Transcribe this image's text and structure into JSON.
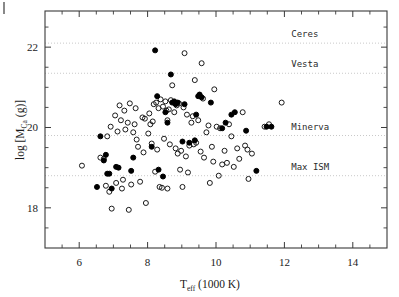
{
  "chart_data": {
    "type": "scatter",
    "title": "",
    "xlabel": "T_eff (1000 K)",
    "xlabel_main": "T",
    "xlabel_sub": "eff",
    "xlabel_rest": "(1000 K)",
    "ylabel": "log [M_Ca (g)]",
    "ylabel_main_a": "log [M",
    "ylabel_sub": "Ca",
    "ylabel_main_b": " (g)]",
    "xlim": [
      5.0,
      15.0
    ],
    "ylim": [
      17.0,
      22.9
    ],
    "xticks": [
      6,
      8,
      10,
      12,
      14
    ],
    "xtick_labels": [
      "6",
      "8",
      "10",
      "12",
      "14"
    ],
    "xminorticks": [
      5.5,
      6.5,
      7.0,
      7.5,
      8.5,
      9.0,
      9.5,
      10.5,
      11.0,
      11.5,
      12.5,
      13.0,
      13.5,
      14.5
    ],
    "yticks": [
      18,
      20,
      22
    ],
    "ytick_labels": [
      "18",
      "20",
      "22"
    ],
    "yminorticks": [
      17.5,
      18.5,
      19.0,
      19.5,
      20.5,
      21.0,
      21.5,
      22.5
    ],
    "grid": false,
    "legend": "none",
    "reference_lines": [
      {
        "label": "Ceres",
        "y": 22.1,
        "style": "dotted",
        "label_x": 12.2
      },
      {
        "label": "Vesta",
        "y": 21.35,
        "style": "dotted",
        "label_x": 12.2
      },
      {
        "label": "Minerva",
        "y": 19.8,
        "style": "dotted",
        "label_x": 12.2
      },
      {
        "label": "Max ISM",
        "y": 18.8,
        "style": "dotted",
        "label_x": 12.2
      }
    ],
    "series": [
      {
        "name": "open",
        "marker": "open-circle",
        "points": [
          [
            6.08,
            19.05
          ],
          [
            6.62,
            19.25
          ],
          [
            6.72,
            19.22
          ],
          [
            6.78,
            18.55
          ],
          [
            6.82,
            19.78
          ],
          [
            6.88,
            18.4
          ],
          [
            6.92,
            20.02
          ],
          [
            6.95,
            17.98
          ],
          [
            7.05,
            20.3
          ],
          [
            7.08,
            18.62
          ],
          [
            7.12,
            19.9
          ],
          [
            7.18,
            20.55
          ],
          [
            7.22,
            20.18
          ],
          [
            7.25,
            18.48
          ],
          [
            7.28,
            18.7
          ],
          [
            7.32,
            20.42
          ],
          [
            7.35,
            19.95
          ],
          [
            7.42,
            20.12
          ],
          [
            7.45,
            17.95
          ],
          [
            7.48,
            20.6
          ],
          [
            7.52,
            18.58
          ],
          [
            7.58,
            19.88
          ],
          [
            7.62,
            20.08
          ],
          [
            7.68,
            19.7
          ],
          [
            7.72,
            19.52
          ],
          [
            7.78,
            18.65
          ],
          [
            7.85,
            20.25
          ],
          [
            7.88,
            19.38
          ],
          [
            7.92,
            20.22
          ],
          [
            7.95,
            18.12
          ],
          [
            8.02,
            19.85
          ],
          [
            8.05,
            20.35
          ],
          [
            8.08,
            20.08
          ],
          [
            8.12,
            19.6
          ],
          [
            8.18,
            20.58
          ],
          [
            8.22,
            18.9
          ],
          [
            8.25,
            20.62
          ],
          [
            8.28,
            19.45
          ],
          [
            8.32,
            20.48
          ],
          [
            8.35,
            18.52
          ],
          [
            8.38,
            20.7
          ],
          [
            8.42,
            18.5
          ],
          [
            8.45,
            20.52
          ],
          [
            8.48,
            19.72
          ],
          [
            8.52,
            20.65
          ],
          [
            8.55,
            20.42
          ],
          [
            8.58,
            18.48
          ],
          [
            8.62,
            20.45
          ],
          [
            8.65,
            19.58
          ],
          [
            8.68,
            20.68
          ],
          [
            8.72,
            21.05
          ],
          [
            8.78,
            20.38
          ],
          [
            8.82,
            19.48
          ],
          [
            8.85,
            20.55
          ],
          [
            8.88,
            19.35
          ],
          [
            8.92,
            20.6
          ],
          [
            8.95,
            18.95
          ],
          [
            8.98,
            19.42
          ],
          [
            9.02,
            18.52
          ],
          [
            9.05,
            20.5
          ],
          [
            9.08,
            21.85
          ],
          [
            9.12,
            19.28
          ],
          [
            9.15,
            20.32
          ],
          [
            9.18,
            18.88
          ],
          [
            9.22,
            19.55
          ],
          [
            9.28,
            20.12
          ],
          [
            9.32,
            20.28
          ],
          [
            9.38,
            21.18
          ],
          [
            9.42,
            19.62
          ],
          [
            9.48,
            20.18
          ],
          [
            9.52,
            20.8
          ],
          [
            9.55,
            19.4
          ],
          [
            9.58,
            21.6
          ],
          [
            9.62,
            20.72
          ],
          [
            9.65,
            19.25
          ],
          [
            9.72,
            19.88
          ],
          [
            9.78,
            20.05
          ],
          [
            9.82,
            18.62
          ],
          [
            9.88,
            19.52
          ],
          [
            9.92,
            19.15
          ],
          [
            10.02,
            20.02
          ],
          [
            10.08,
            18.8
          ],
          [
            10.12,
            19.98
          ],
          [
            10.18,
            19.08
          ],
          [
            10.25,
            19.42
          ],
          [
            10.32,
            19.12
          ],
          [
            10.38,
            20.08
          ],
          [
            10.45,
            19.78
          ],
          [
            10.52,
            19.02
          ],
          [
            10.62,
            19.48
          ],
          [
            10.68,
            19.22
          ],
          [
            10.78,
            20.38
          ],
          [
            10.85,
            19.55
          ],
          [
            10.92,
            19.45
          ],
          [
            10.95,
            18.72
          ],
          [
            11.05,
            19.35
          ],
          [
            11.42,
            20.02
          ],
          [
            11.55,
            20.08
          ],
          [
            11.92,
            20.62
          ],
          [
            9.95,
            20.95
          ],
          [
            8.15,
            20.15
          ],
          [
            8.58,
            20.18
          ],
          [
            9.35,
            19.58
          ],
          [
            7.65,
            20.48
          ]
        ]
      },
      {
        "name": "filled",
        "marker": "filled-circle",
        "points": [
          [
            6.52,
            18.52
          ],
          [
            6.62,
            19.78
          ],
          [
            6.72,
            19.18
          ],
          [
            6.78,
            19.32
          ],
          [
            6.82,
            18.85
          ],
          [
            6.88,
            18.85
          ],
          [
            6.95,
            18.48
          ],
          [
            7.08,
            19.02
          ],
          [
            7.15,
            19.0
          ],
          [
            7.52,
            18.92
          ],
          [
            7.58,
            19.25
          ],
          [
            8.12,
            19.52
          ],
          [
            8.22,
            21.92
          ],
          [
            8.28,
            20.78
          ],
          [
            8.32,
            18.95
          ],
          [
            8.45,
            18.78
          ],
          [
            8.52,
            20.38
          ],
          [
            8.58,
            20.12
          ],
          [
            8.68,
            21.32
          ],
          [
            8.72,
            20.62
          ],
          [
            8.78,
            20.65
          ],
          [
            8.82,
            20.58
          ],
          [
            9.08,
            20.58
          ],
          [
            9.22,
            19.62
          ],
          [
            9.38,
            19.68
          ],
          [
            9.42,
            20.32
          ],
          [
            9.48,
            20.78
          ],
          [
            9.52,
            20.82
          ],
          [
            9.58,
            20.75
          ],
          [
            9.85,
            20.62
          ],
          [
            10.18,
            19.98
          ],
          [
            10.28,
            20.12
          ],
          [
            10.45,
            20.32
          ],
          [
            10.55,
            20.38
          ],
          [
            10.88,
            19.92
          ],
          [
            11.18,
            18.92
          ],
          [
            11.48,
            20.02
          ],
          [
            11.62,
            20.02
          ],
          [
            8.88,
            20.62
          ],
          [
            9.02,
            19.65
          ]
        ]
      }
    ]
  },
  "colors": {
    "axis": "#3a3a3a",
    "text": "#1a1a1a",
    "marker_fill": "#000000",
    "marker_open_stroke": "#1a1a1a",
    "reference_line": "#c9c9c9",
    "annotation_text": "#2b2b2b",
    "background": "#ffffff"
  }
}
